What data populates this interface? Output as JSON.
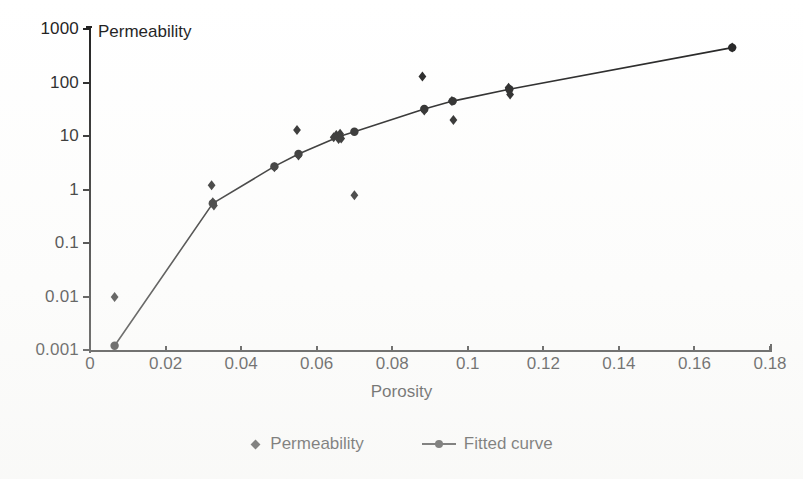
{
  "chart_data": {
    "type": "scatter",
    "title": "",
    "xlabel": "Porosity",
    "ylabel": "Permeability",
    "ylabel_position": "inside-top-left",
    "xlim": [
      0,
      0.18
    ],
    "ylim": [
      0.001,
      1000
    ],
    "yscale": "log",
    "xscale": "linear",
    "grid": false,
    "legend_position": "bottom-center",
    "xticks": [
      "0",
      "0.02",
      "0.04",
      "0.06",
      "0.08",
      "0.1",
      "0.12",
      "0.14",
      "0.16",
      "0.18"
    ],
    "xtick_values": [
      0,
      0.02,
      0.04,
      0.06,
      0.08,
      0.1,
      0.12,
      0.14,
      0.16,
      0.18
    ],
    "yticks": [
      "1000",
      "100",
      "10",
      "1",
      "0.1",
      "0.01",
      "0.001"
    ],
    "ytick_values": [
      1000,
      100,
      10,
      1,
      0.1,
      0.01,
      0.001
    ],
    "series": [
      {
        "name": "Permeability",
        "type": "scatter",
        "marker": "diamond",
        "color": "#1d1d1d",
        "points": [
          {
            "x": 0.0065,
            "y": 0.0098
          },
          {
            "x": 0.0322,
            "y": 1.2
          },
          {
            "x": 0.0325,
            "y": 0.58
          },
          {
            "x": 0.0328,
            "y": 0.5
          },
          {
            "x": 0.0488,
            "y": 2.6
          },
          {
            "x": 0.0548,
            "y": 13.0
          },
          {
            "x": 0.0552,
            "y": 4.3
          },
          {
            "x": 0.0645,
            "y": 9.5
          },
          {
            "x": 0.0652,
            "y": 10.5
          },
          {
            "x": 0.0658,
            "y": 8.8
          },
          {
            "x": 0.0662,
            "y": 11.0
          },
          {
            "x": 0.0665,
            "y": 9.0
          },
          {
            "x": 0.07,
            "y": 0.78
          },
          {
            "x": 0.088,
            "y": 130.0
          },
          {
            "x": 0.0885,
            "y": 30.0
          },
          {
            "x": 0.0958,
            "y": 45.0
          },
          {
            "x": 0.0962,
            "y": 20.0
          },
          {
            "x": 0.1108,
            "y": 80.0
          },
          {
            "x": 0.1112,
            "y": 60.0
          },
          {
            "x": 0.17,
            "y": 450.0
          }
        ]
      },
      {
        "name": "Fitted curve",
        "type": "line",
        "marker": "circle",
        "color": "#1d1d1d",
        "points": [
          {
            "x": 0.0065,
            "y": 0.0012
          },
          {
            "x": 0.0325,
            "y": 0.55
          },
          {
            "x": 0.0488,
            "y": 2.7
          },
          {
            "x": 0.0552,
            "y": 4.6
          },
          {
            "x": 0.066,
            "y": 9.8
          },
          {
            "x": 0.07,
            "y": 12.0
          },
          {
            "x": 0.0885,
            "y": 32.0
          },
          {
            "x": 0.096,
            "y": 45.0
          },
          {
            "x": 0.111,
            "y": 75.0
          },
          {
            "x": 0.17,
            "y": 450.0
          }
        ]
      }
    ]
  },
  "axes": {
    "y_title": "Permeability",
    "x_title": "Porosity"
  },
  "legend": {
    "entries": [
      {
        "label": "Permeability",
        "key": "diamond-marker-icon"
      },
      {
        "label": "Fitted curve",
        "key": "line-with-dot-icon"
      }
    ]
  },
  "colors": {
    "ink": "#1d1d1d",
    "paper": "#ffffff"
  }
}
